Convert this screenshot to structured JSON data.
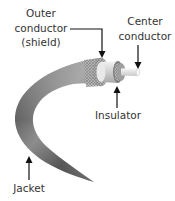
{
  "diagram": {
    "labels": {
      "outer_conductor": {
        "line1": "Outer",
        "line2": "conductor",
        "line3": "(shield)"
      },
      "center_conductor": {
        "line1": "Center",
        "line2": "conductor"
      },
      "insulator": {
        "line1": "Insulator"
      },
      "jacket": {
        "line1": "Jacket"
      }
    },
    "colors": {
      "background": "#ffffff",
      "text": "#333333",
      "arrow": "#111111",
      "jacket_dark": "#3a3a3a",
      "jacket_mid": "#7a7a7a",
      "jacket_light": "#bdbdbd",
      "shield": "#a9a9a9",
      "insulator": "#e6e6e6",
      "center_conductor": "#f2f2f2"
    }
  }
}
